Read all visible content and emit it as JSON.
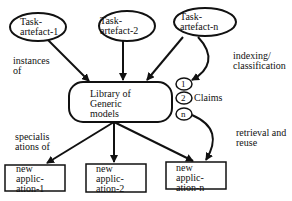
{
  "diagram": {
    "task_artefacts": [
      {
        "line1": "Task-",
        "line2": "artefact-1"
      },
      {
        "line1": "Task-",
        "line2": "artefact-2"
      },
      {
        "line1": "Task-",
        "line2": "artefact-n"
      }
    ],
    "library": {
      "line1": "Library of",
      "line2": "Generic",
      "line3": "models"
    },
    "claims": {
      "items": [
        "1",
        "2",
        "n"
      ],
      "label": "Claims"
    },
    "applications": [
      {
        "line1": "new",
        "line2": "applic-",
        "line3": "ation-1"
      },
      {
        "line1": "new",
        "line2": "applic-",
        "line3": "ation-2"
      },
      {
        "line1": "new",
        "line2": "applic-",
        "line3": "ation-n"
      }
    ],
    "edge_labels": {
      "instances": {
        "line1": "instances",
        "line2": "of"
      },
      "indexing": {
        "line1": "indexing/",
        "line2": "classification"
      },
      "specialisations": {
        "line1": "specialis",
        "line2": "ations of"
      },
      "retrieval": {
        "line1": "retrieval and",
        "line2": "reuse"
      }
    }
  }
}
